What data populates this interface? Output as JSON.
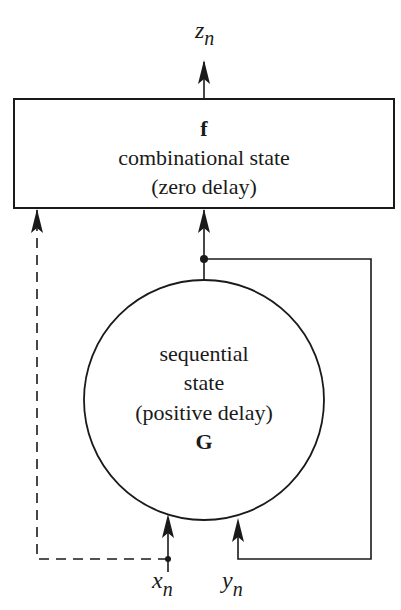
{
  "diagram": {
    "output_label": "z",
    "output_subscript": "n",
    "combinational_block": {
      "function_symbol": "f",
      "line1": "combinational state",
      "line2": "(zero delay)"
    },
    "sequential_block": {
      "line1": "sequential",
      "line2": "state",
      "line3": "(positive delay)",
      "function_symbol": "G"
    },
    "input_x_label": "x",
    "input_x_subscript": "n",
    "input_y_label": "y",
    "input_y_subscript": "n",
    "edges": [
      {
        "from": "combinational_block",
        "to": "output",
        "style": "solid"
      },
      {
        "from": "sequential_block",
        "to": "combinational_block",
        "style": "solid"
      },
      {
        "from": "sequential_block",
        "to": "input_y",
        "style": "solid",
        "role": "feedback"
      },
      {
        "from": "input_x",
        "to": "sequential_block",
        "style": "solid"
      },
      {
        "from": "input_y",
        "to": "sequential_block",
        "style": "solid"
      },
      {
        "from": "input_x",
        "to": "combinational_block",
        "style": "dashed"
      }
    ]
  }
}
